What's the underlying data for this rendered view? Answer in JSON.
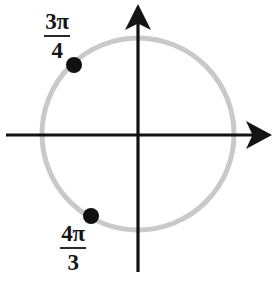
{
  "figure": {
    "name": "unit-circle-with-marked-angles",
    "width": 274,
    "height": 282,
    "background_color": "#ffffff"
  },
  "colors": {
    "circle": "#c9c9c9",
    "axis": "#111111",
    "point": "#101010",
    "label_text": "#151515"
  },
  "circle": {
    "center_x": 138,
    "center_y": 134,
    "radius": 96,
    "stroke_width": 5,
    "color": "#c9c9c9"
  },
  "axes": {
    "horizontal": {
      "label": "x-axis",
      "y": 135,
      "x_start": 6,
      "x_end": 272,
      "arrow": "right"
    },
    "vertical": {
      "label": "y-axis",
      "x": 138,
      "y_start": 272,
      "y_end": 4,
      "arrow": "up"
    }
  },
  "points": [
    {
      "id": "point-3pi-over-4",
      "angle_label": "3π/4",
      "numerator": "3π",
      "denominator": "4",
      "x": 74,
      "y": 65,
      "radius": 8
    },
    {
      "id": "point-4pi-over-3",
      "angle_label": "4π/3",
      "numerator": "4π",
      "denominator": "3",
      "x": 91,
      "y": 216,
      "radius": 8
    }
  ],
  "labels": {
    "upper": {
      "name": "3pi-over-4",
      "numerator": "3π",
      "denominator": "4"
    },
    "lower": {
      "name": "4pi-over-3",
      "numerator": "4π",
      "denominator": "3"
    }
  }
}
